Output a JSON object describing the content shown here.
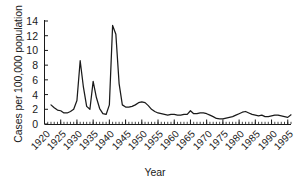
{
  "chart_data": {
    "type": "line",
    "title": "",
    "xlabel": "Year",
    "ylabel": "Cases per 100,000 population",
    "xlim": [
      1920,
      1996
    ],
    "ylim": [
      0,
      14.8
    ],
    "grid": false,
    "legend": false,
    "line_color": "#1a1a1a",
    "xtick_labels": [
      "1920",
      "1925",
      "1930",
      "1935",
      "1940",
      "1945",
      "1950",
      "1955",
      "1960",
      "1965",
      "1970",
      "1975",
      "1980",
      "1985",
      "1990",
      "1995"
    ],
    "xtick_values": [
      1920,
      1925,
      1930,
      1935,
      1940,
      1945,
      1950,
      1955,
      1960,
      1965,
      1970,
      1975,
      1980,
      1985,
      1990,
      1995
    ],
    "xtick_minor_step": 1,
    "ytick_labels": [
      "0",
      "2",
      "4",
      "6",
      "8",
      "10",
      "12",
      "14"
    ],
    "ytick_values": [
      0,
      2,
      4,
      6,
      8,
      10,
      12,
      14
    ],
    "series": [
      {
        "name": "Cases per 100,000 population",
        "x": [
          1922,
          1923,
          1924,
          1925,
          1926,
          1927,
          1928,
          1929,
          1930,
          1931,
          1932,
          1933,
          1934,
          1935,
          1936,
          1937,
          1938,
          1939,
          1940,
          1941,
          1942,
          1943,
          1944,
          1945,
          1946,
          1947,
          1948,
          1949,
          1950,
          1951,
          1952,
          1953,
          1954,
          1955,
          1956,
          1957,
          1958,
          1959,
          1960,
          1961,
          1962,
          1963,
          1964,
          1965,
          1966,
          1967,
          1968,
          1969,
          1970,
          1971,
          1972,
          1973,
          1974,
          1975,
          1976,
          1977,
          1978,
          1979,
          1980,
          1981,
          1982,
          1983,
          1984,
          1985,
          1986,
          1987,
          1988,
          1989,
          1990,
          1991,
          1992,
          1993,
          1994,
          1995,
          1996
        ],
        "y": [
          2.6,
          2.2,
          1.9,
          1.8,
          1.5,
          1.5,
          1.7,
          2.0,
          3.2,
          8.6,
          5.0,
          2.4,
          2.0,
          5.8,
          3.6,
          2.1,
          1.4,
          1.3,
          2.6,
          13.4,
          12.2,
          5.5,
          2.6,
          2.3,
          2.3,
          2.4,
          2.6,
          2.9,
          3.0,
          2.9,
          2.5,
          2.0,
          1.7,
          1.5,
          1.4,
          1.3,
          1.2,
          1.3,
          1.3,
          1.2,
          1.2,
          1.3,
          1.3,
          1.8,
          1.4,
          1.4,
          1.5,
          1.5,
          1.4,
          1.2,
          1.0,
          0.75,
          0.7,
          0.7,
          0.8,
          0.9,
          1.0,
          1.2,
          1.4,
          1.6,
          1.7,
          1.5,
          1.3,
          1.2,
          1.1,
          1.2,
          1.0,
          1.0,
          1.1,
          1.2,
          1.2,
          1.1,
          1.0,
          0.9,
          1.25
        ]
      }
    ]
  },
  "axes": {
    "y_axis_name": "y-axis",
    "x_axis_name": "x-axis"
  }
}
